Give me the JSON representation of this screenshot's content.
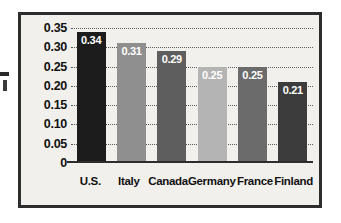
{
  "chart_data": {
    "type": "bar",
    "title": "",
    "xlabel": "",
    "ylabel": "",
    "categories": [
      "U.S.",
      "Italy",
      "Canada",
      "Germany",
      "France",
      "Finland"
    ],
    "values": [
      0.34,
      0.31,
      0.29,
      0.25,
      0.25,
      0.21
    ],
    "value_labels": [
      "0.34",
      "0.31",
      "0.29",
      "0.25",
      "0.25",
      "0.21"
    ],
    "bar_colors": [
      "#1c1c1c",
      "#8f8f8f",
      "#5e5e5e",
      "#b4b4b4",
      "#6b6b6b",
      "#3c3c3c"
    ],
    "ylim": [
      0,
      0.35
    ],
    "ytick_values": [
      0.35,
      0.3,
      0.25,
      0.2,
      0.15,
      0.1,
      0.05,
      0
    ],
    "ytick_labels": [
      "0.35",
      "0.30",
      "0.25",
      "0.20",
      "0.15",
      "0.10",
      "0.05",
      "0"
    ],
    "grid": "horizontal-dotted",
    "legend": "none",
    "plot_background": "#f1f0ec",
    "frame_color": "#2d2d2d",
    "label_color": "#ffffff"
  }
}
